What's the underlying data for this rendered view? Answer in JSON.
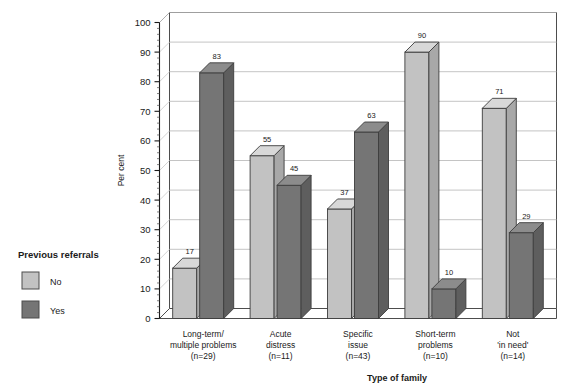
{
  "chart_data": {
    "type": "bar",
    "title": "",
    "subtitle": "",
    "xlabel": "Type of family",
    "ylabel": "Per cent",
    "ylim": [
      0,
      100
    ],
    "ytick_step": 10,
    "yticks": [
      0,
      10,
      20,
      30,
      40,
      50,
      60,
      70,
      80,
      90,
      100
    ],
    "grid": true,
    "grid_axis": "y",
    "legend_position": "left-outside",
    "legend_title": "Previous referrals",
    "style": "3d-grouped-columns",
    "categories": [
      "Long-term/ multiple problems (n=29)",
      "Acute distress (n=11)",
      "Specific issue (n=43)",
      "Short-term problems (n=10)",
      "Not 'in need' (n=14)"
    ],
    "category_lines": [
      [
        "Long-term/",
        "multiple problems",
        "(n=29)"
      ],
      [
        "Acute",
        "distress",
        "(n=11)"
      ],
      [
        "Specific",
        "issue",
        "(n=43)"
      ],
      [
        "Short-term",
        "problems",
        "(n=10)"
      ],
      [
        "Not",
        "'in need'",
        "(n=14)"
      ]
    ],
    "series": [
      {
        "name": "No",
        "color": "#c2c2c2",
        "values": [
          17,
          55,
          37,
          90,
          71
        ]
      },
      {
        "name": "Yes",
        "color": "#757575",
        "values": [
          83,
          45,
          63,
          10,
          29
        ]
      }
    ]
  },
  "legend": {
    "title": "Previous referrals",
    "items": [
      {
        "label": "No",
        "color": "#c2c2c2"
      },
      {
        "label": "Yes",
        "color": "#757575"
      }
    ]
  },
  "axes": {
    "y_title": "Per cent",
    "x_title": "Type of family"
  }
}
